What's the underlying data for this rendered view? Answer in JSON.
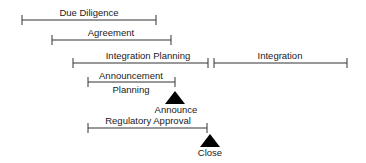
{
  "diagram": {
    "colors": {
      "line": "#333333",
      "text": "#1a1a1a",
      "milestone": "#000000",
      "background": "#ffffff"
    },
    "bars": [
      {
        "id": "due-diligence",
        "label": "Due Diligence",
        "x1": 22,
        "x2": 156,
        "y": 20,
        "label_x": 89,
        "label_y": 16
      },
      {
        "id": "agreement",
        "label": "Agreement",
        "x1": 52,
        "x2": 171,
        "y": 40,
        "label_x": 111,
        "label_y": 36
      },
      {
        "id": "integration-planning",
        "label": "Integration Planning",
        "x1": 73,
        "x2": 208,
        "y": 63,
        "label_x": 148,
        "label_y": 59
      },
      {
        "id": "integration",
        "label": "Integration",
        "x1": 214,
        "x2": 347,
        "y": 63,
        "label_x": 280,
        "label_y": 59
      },
      {
        "id": "announcement-planning",
        "label": "Announcement",
        "label2": "Planning",
        "x1": 88,
        "x2": 175,
        "y": 82,
        "label_x": 131,
        "label_y": 79,
        "label2_y": 92
      },
      {
        "id": "regulatory-approval",
        "label": "Regulatory Approval",
        "x1": 88,
        "x2": 207,
        "y": 128,
        "label_x": 148,
        "label_y": 124
      }
    ],
    "milestones": [
      {
        "id": "announce",
        "label": "Announce",
        "x": 175,
        "apex_y": 92,
        "base_y": 104,
        "half_width": 9,
        "label_y": 113
      },
      {
        "id": "close",
        "label": "Close",
        "x": 210,
        "apex_y": 135,
        "base_y": 147,
        "half_width": 9,
        "label_y": 156
      }
    ],
    "labels": {
      "due_diligence": "Due Diligence",
      "agreement": "Agreement",
      "integration_planning": "Integration Planning",
      "integration": "Integration",
      "announcement_planning_line1": "Announcement",
      "announcement_planning_line2": "Planning",
      "regulatory_approval": "Regulatory Approval",
      "announce": "Announce",
      "close": "Close"
    }
  }
}
